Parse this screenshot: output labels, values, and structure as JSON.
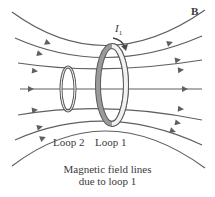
{
  "diagram": {
    "field_label": "B",
    "current_label": "I",
    "current_subscript": "1",
    "loop2_label": "Loop 2",
    "loop1_label": "Loop 1",
    "caption_line1": "Magnetic field lines",
    "caption_line2": "due to loop 1",
    "colors": {
      "field_line": "#5f5f5f",
      "loop_fill": "#8c8c8c",
      "loop_edge": "#5a5a5a",
      "text": "#3a3a3a"
    }
  }
}
